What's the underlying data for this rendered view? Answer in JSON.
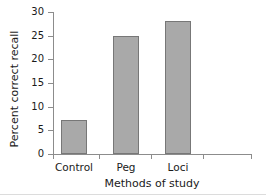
{
  "chart_data": {
    "type": "bar",
    "title": "",
    "subtitle": "",
    "categories": [
      "Control",
      "Peg",
      "Loci"
    ],
    "values": [
      7.2,
      25,
      28
    ],
    "series": [
      {
        "name": "Percent correct recall",
        "values": [
          7.2,
          25,
          28
        ]
      }
    ],
    "xlabel": "Methods of study",
    "ylabel": "Percent correct recall",
    "ylim": [
      0,
      30
    ],
    "yticks": [
      0,
      5,
      10,
      15,
      20,
      25,
      30
    ],
    "ytick_labels": [
      "0",
      "5",
      "10",
      "15",
      "20",
      "25",
      "30"
    ],
    "grid": false,
    "legend": false,
    "legend_position": "none",
    "bar_color": "#a9a9a9",
    "bar_edge_color": "#777777",
    "axis_color": "#8c8c8c",
    "text_color": "#1a1a1a",
    "background_color": "#ffffff",
    "annotations": []
  }
}
